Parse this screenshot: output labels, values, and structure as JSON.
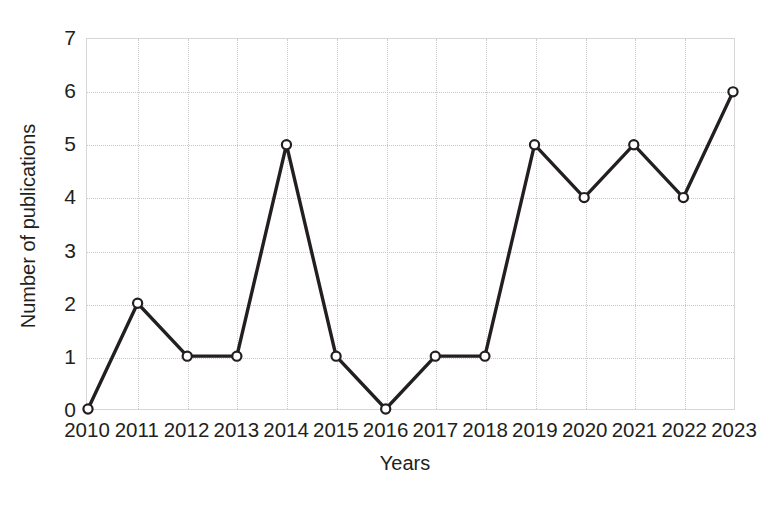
{
  "chart_data": {
    "type": "line",
    "title": "",
    "subtitle": "",
    "xlabel": "Years",
    "ylabel": "Number of publications",
    "categories": [
      "2010",
      "2011",
      "2012",
      "2013",
      "2014",
      "2015",
      "2016",
      "2017",
      "2018",
      "2019",
      "2020",
      "2021",
      "2022",
      "2023"
    ],
    "values": [
      0,
      2,
      1,
      1,
      5,
      1,
      0,
      1,
      1,
      5,
      4,
      5,
      4,
      6
    ],
    "series": [
      {
        "name": "Number of publications",
        "values": [
          0,
          2,
          1,
          1,
          5,
          1,
          0,
          1,
          1,
          5,
          4,
          5,
          4,
          6
        ]
      }
    ],
    "ylim": [
      0,
      7
    ],
    "yticks": [
      "0",
      "1",
      "2",
      "3",
      "4",
      "5",
      "6",
      "7"
    ],
    "ytick_values": [
      0,
      1,
      2,
      3,
      4,
      5,
      6,
      7
    ],
    "grid": true,
    "grid_color": "#c9c9c9",
    "legend": false,
    "legend_position": "none",
    "line_color": "#231f20",
    "marker_fill": "#ffffff",
    "marker_edge": "#231f20",
    "marker": "circle",
    "annotations": []
  }
}
